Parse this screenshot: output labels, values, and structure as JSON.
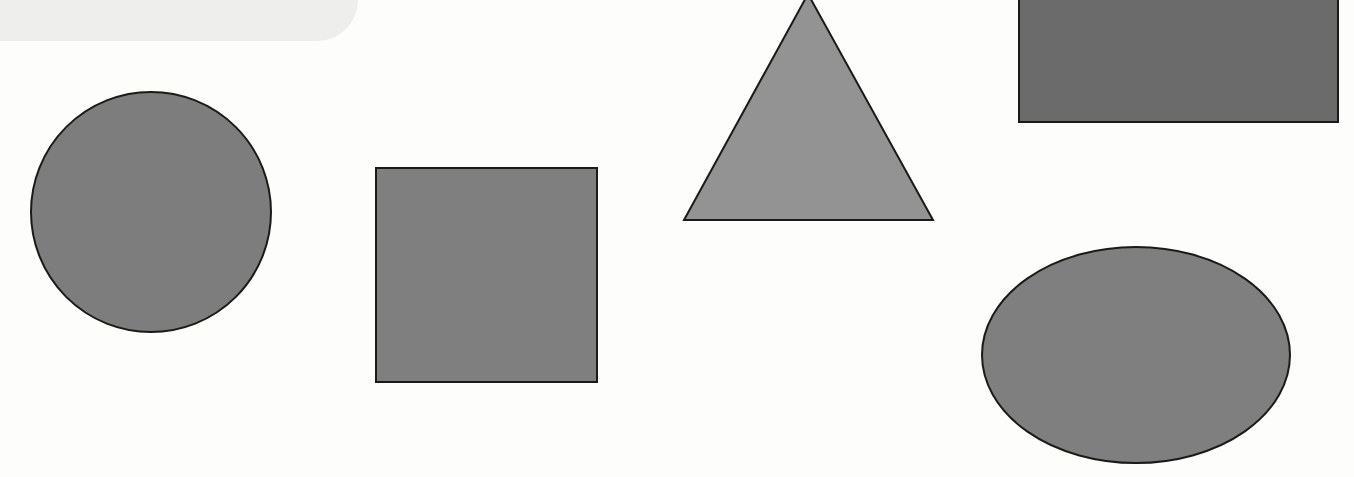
{
  "figure": {
    "background": "#fdfdfc",
    "corner_tab_color": "#eeeeed",
    "stroke_color": "#1a1a1a",
    "shapes": [
      {
        "type": "circle",
        "name": "circle",
        "fill": "#7d7d7d",
        "cx": 151,
        "cy": 212,
        "r": 120
      },
      {
        "type": "square",
        "name": "square",
        "fill": "#7f7f7f",
        "x": 376,
        "y": 168,
        "w": 221,
        "h": 214
      },
      {
        "type": "triangle",
        "name": "triangle",
        "fill": "#939393",
        "points": "808,-6 684,220 933,220"
      },
      {
        "type": "rectangle",
        "name": "rectangle",
        "fill": "#6b6b6b",
        "x": 1019,
        "y": -5,
        "w": 319,
        "h": 127
      },
      {
        "type": "ellipse",
        "name": "ellipse",
        "fill": "#7f7f7f",
        "cx": 1136,
        "cy": 355,
        "rx": 154,
        "ry": 108
      }
    ]
  }
}
